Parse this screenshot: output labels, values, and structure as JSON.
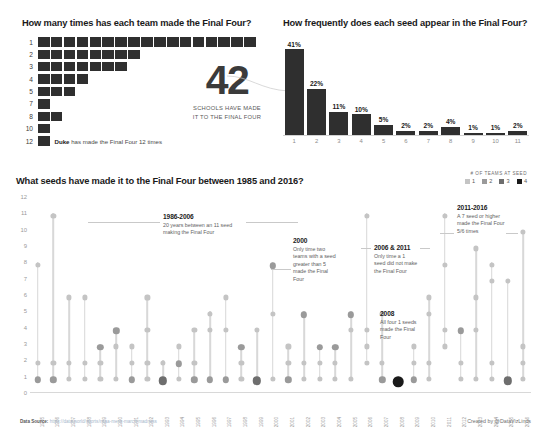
{
  "teams_panel": {
    "title": "How many times has each team made the Final Four?",
    "rows": [
      {
        "label": "1",
        "count": 17,
        "note": ""
      },
      {
        "label": "2",
        "count": 8,
        "note": ""
      },
      {
        "label": "3",
        "count": 7,
        "note": ""
      },
      {
        "label": "4",
        "count": 4,
        "note": ""
      },
      {
        "label": "5",
        "count": 3,
        "note": ""
      },
      {
        "label": "7",
        "count": 1,
        "note": ""
      },
      {
        "label": "8",
        "count": 2,
        "note": ""
      },
      {
        "label": "10",
        "count": 1,
        "note": ""
      },
      {
        "label": "12",
        "count": 1,
        "note_bold": "Duke",
        "note": " has made the Final Four 12 times"
      }
    ]
  },
  "callout": {
    "number": "42",
    "line1": "SCHOOLS HAVE MADE",
    "line2": "IT TO THE FINAL FOUR"
  },
  "freq_panel": {
    "title": "How frequently does each seed appear in the Final Four?"
  },
  "main_panel": {
    "title": "What seeds have made it to the Final Four between 1985 and 2016?",
    "legend_title": "# OF TEAMS AT SEED",
    "legend": [
      {
        "label": "1",
        "color": "#c4c4c4"
      },
      {
        "label": "2",
        "color": "#9a9a9a"
      },
      {
        "label": "3",
        "color": "#6e6e6e"
      },
      {
        "label": "4",
        "color": "#1a1a1a"
      }
    ]
  },
  "annotations": [
    {
      "id": "1986-2006",
      "heading": "1986-2006",
      "body": "20 years between an 11 seed making the Final Four"
    },
    {
      "id": "2000",
      "heading": "2000",
      "body": "Only time two teams with a seed greater than 5 made the Final Four"
    },
    {
      "id": "2006-2011",
      "heading": "2006 & 2011",
      "body": "Only time a 1 seed did not make the Final Four"
    },
    {
      "id": "2008",
      "heading": "2008",
      "body": "All four 1 seeds made the Final Four"
    },
    {
      "id": "2011-2016",
      "heading": "2011-2016",
      "body": "A 7 seed or higher made the Final Four 5/6 times"
    }
  ],
  "footer": {
    "source_label": "Data Source:",
    "source_url": "https://data.world/sports/ncaa-mens-march-madness",
    "credit": "Created by @DataVizLinds"
  },
  "chart_data": [
    {
      "type": "bar",
      "id": "team-appearance-counts",
      "title": "How many times has each team made the Final Four?",
      "orientation": "horizontal",
      "xlabel": "Number of schools",
      "ylabel": "Times made Final Four",
      "categories": [
        "1",
        "2",
        "3",
        "4",
        "5",
        "7",
        "8",
        "10",
        "12"
      ],
      "values": [
        17,
        8,
        7,
        4,
        3,
        1,
        2,
        1,
        1
      ],
      "note": "Bars are segmented — one block per school. Duke has made the Final Four 12 times.",
      "grid": false,
      "legend": "none"
    },
    {
      "type": "bar",
      "id": "seed-frequency",
      "title": "How frequently does each seed appear in the Final Four?",
      "xlabel": "Seed",
      "ylabel": "Percent of Final Four appearances",
      "categories": [
        "1",
        "2",
        "3",
        "4",
        "5",
        "6",
        "7",
        "8",
        "9",
        "10",
        "11"
      ],
      "values": [
        41,
        22,
        11,
        10,
        5,
        2,
        2,
        4,
        1,
        1,
        2
      ],
      "value_labels": [
        "41%",
        "22%",
        "11%",
        "10%",
        "5%",
        "2%",
        "2%",
        "4%",
        "1%",
        "1%",
        "2%"
      ],
      "ylim": [
        0,
        41
      ],
      "grid": false,
      "legend": "none"
    },
    {
      "type": "scatter",
      "id": "seeds-by-year",
      "title": "What seeds have made it to the Final Four between 1985 and 2016?",
      "xlabel": "Year",
      "ylabel": "Seed",
      "ylim": [
        0,
        12
      ],
      "yticks": [
        0,
        1,
        2,
        3,
        4,
        5,
        6,
        7,
        8,
        9,
        10,
        11,
        12
      ],
      "x": [
        "1985",
        "1986",
        "1987",
        "1988",
        "1989",
        "1990",
        "1991",
        "1992",
        "1993",
        "1994",
        "1995",
        "1996",
        "1997",
        "1998",
        "1999",
        "2000",
        "2001",
        "2002",
        "2003",
        "2004",
        "2005",
        "2006",
        "2007",
        "2008",
        "2009",
        "2010",
        "2011",
        "2012",
        "2013",
        "2014",
        "2015",
        "2016"
      ],
      "legend_title": "# OF TEAMS AT SEED",
      "legend_position": "top-right",
      "size_encoding": "marker size and darkness encode number of teams at that seed (1-4)",
      "grid": false,
      "points": [
        {
          "year": "1985",
          "seeds": [
            {
              "seed": 1,
              "teams": 2
            },
            {
              "seed": 2,
              "teams": 1
            },
            {
              "seed": 8,
              "teams": 1
            }
          ]
        },
        {
          "year": "1986",
          "seeds": [
            {
              "seed": 1,
              "teams": 2
            },
            {
              "seed": 2,
              "teams": 1
            },
            {
              "seed": 11,
              "teams": 1
            }
          ]
        },
        {
          "year": "1987",
          "seeds": [
            {
              "seed": 1,
              "teams": 1
            },
            {
              "seed": 2,
              "teams": 1
            },
            {
              "seed": 6,
              "teams": 1
            }
          ]
        },
        {
          "year": "1988",
          "seeds": [
            {
              "seed": 1,
              "teams": 1
            },
            {
              "seed": 2,
              "teams": 1
            },
            {
              "seed": 6,
              "teams": 1
            }
          ]
        },
        {
          "year": "1989",
          "seeds": [
            {
              "seed": 1,
              "teams": 1
            },
            {
              "seed": 2,
              "teams": 1
            },
            {
              "seed": 3,
              "teams": 2
            }
          ]
        },
        {
          "year": "1990",
          "seeds": [
            {
              "seed": 1,
              "teams": 1
            },
            {
              "seed": 3,
              "teams": 1
            },
            {
              "seed": 4,
              "teams": 2
            }
          ]
        },
        {
          "year": "1991",
          "seeds": [
            {
              "seed": 1,
              "teams": 2
            },
            {
              "seed": 2,
              "teams": 1
            },
            {
              "seed": 3,
              "teams": 1
            }
          ]
        },
        {
          "year": "1992",
          "seeds": [
            {
              "seed": 1,
              "teams": 1
            },
            {
              "seed": 2,
              "teams": 1
            },
            {
              "seed": 4,
              "teams": 1
            },
            {
              "seed": 6,
              "teams": 1
            }
          ]
        },
        {
          "year": "1993",
          "seeds": [
            {
              "seed": 1,
              "teams": 3
            },
            {
              "seed": 2,
              "teams": 1
            }
          ]
        },
        {
          "year": "1994",
          "seeds": [
            {
              "seed": 1,
              "teams": 1
            },
            {
              "seed": 2,
              "teams": 2
            },
            {
              "seed": 3,
              "teams": 1
            }
          ]
        },
        {
          "year": "1995",
          "seeds": [
            {
              "seed": 1,
              "teams": 2
            },
            {
              "seed": 2,
              "teams": 1
            },
            {
              "seed": 4,
              "teams": 1
            }
          ]
        },
        {
          "year": "1996",
          "seeds": [
            {
              "seed": 1,
              "teams": 2
            },
            {
              "seed": 4,
              "teams": 1
            },
            {
              "seed": 5,
              "teams": 1
            }
          ]
        },
        {
          "year": "1997",
          "seeds": [
            {
              "seed": 1,
              "teams": 2
            },
            {
              "seed": 4,
              "teams": 1
            },
            {
              "seed": 6,
              "teams": 1
            }
          ]
        },
        {
          "year": "1998",
          "seeds": [
            {
              "seed": 1,
              "teams": 1
            },
            {
              "seed": 2,
              "teams": 1
            },
            {
              "seed": 3,
              "teams": 2
            }
          ]
        },
        {
          "year": "1999",
          "seeds": [
            {
              "seed": 1,
              "teams": 3
            },
            {
              "seed": 4,
              "teams": 1
            }
          ]
        },
        {
          "year": "2000",
          "seeds": [
            {
              "seed": 1,
              "teams": 1
            },
            {
              "seed": 5,
              "teams": 1
            },
            {
              "seed": 8,
              "teams": 2
            }
          ]
        },
        {
          "year": "2001",
          "seeds": [
            {
              "seed": 1,
              "teams": 2
            },
            {
              "seed": 2,
              "teams": 1
            },
            {
              "seed": 3,
              "teams": 1
            }
          ]
        },
        {
          "year": "2002",
          "seeds": [
            {
              "seed": 1,
              "teams": 1
            },
            {
              "seed": 2,
              "teams": 1
            },
            {
              "seed": 5,
              "teams": 2
            }
          ]
        },
        {
          "year": "2003",
          "seeds": [
            {
              "seed": 1,
              "teams": 1
            },
            {
              "seed": 2,
              "teams": 1
            },
            {
              "seed": 3,
              "teams": 2
            }
          ]
        },
        {
          "year": "2004",
          "seeds": [
            {
              "seed": 1,
              "teams": 1
            },
            {
              "seed": 2,
              "teams": 1
            },
            {
              "seed": 3,
              "teams": 2
            }
          ]
        },
        {
          "year": "2005",
          "seeds": [
            {
              "seed": 1,
              "teams": 1
            },
            {
              "seed": 4,
              "teams": 1
            },
            {
              "seed": 5,
              "teams": 2
            }
          ]
        },
        {
          "year": "2006",
          "seeds": [
            {
              "seed": 2,
              "teams": 1
            },
            {
              "seed": 3,
              "teams": 1
            },
            {
              "seed": 4,
              "teams": 1
            },
            {
              "seed": 11,
              "teams": 1
            }
          ]
        },
        {
          "year": "2007",
          "seeds": [
            {
              "seed": 1,
              "teams": 2
            },
            {
              "seed": 2,
              "teams": 1
            },
            {
              "seed": 5,
              "teams": 1
            }
          ]
        },
        {
          "year": "2008",
          "seeds": [
            {
              "seed": 1,
              "teams": 4
            }
          ]
        },
        {
          "year": "2009",
          "seeds": [
            {
              "seed": 1,
              "teams": 2
            },
            {
              "seed": 2,
              "teams": 1
            },
            {
              "seed": 3,
              "teams": 1
            }
          ]
        },
        {
          "year": "2010",
          "seeds": [
            {
              "seed": 1,
              "teams": 1
            },
            {
              "seed": 2,
              "teams": 1
            },
            {
              "seed": 5,
              "teams": 1
            },
            {
              "seed": 6,
              "teams": 1
            }
          ]
        },
        {
          "year": "2011",
          "seeds": [
            {
              "seed": 3,
              "teams": 1
            },
            {
              "seed": 4,
              "teams": 1
            },
            {
              "seed": 8,
              "teams": 1
            },
            {
              "seed": 11,
              "teams": 1
            }
          ]
        },
        {
          "year": "2012",
          "seeds": [
            {
              "seed": 1,
              "teams": 1
            },
            {
              "seed": 2,
              "teams": 1
            },
            {
              "seed": 4,
              "teams": 2
            }
          ]
        },
        {
          "year": "2013",
          "seeds": [
            {
              "seed": 1,
              "teams": 1
            },
            {
              "seed": 4,
              "teams": 1
            },
            {
              "seed": 9,
              "teams": 1
            },
            {
              "seed": 6,
              "teams": 1
            }
          ]
        },
        {
          "year": "2014",
          "seeds": [
            {
              "seed": 1,
              "teams": 1
            },
            {
              "seed": 2,
              "teams": 1
            },
            {
              "seed": 7,
              "teams": 1
            },
            {
              "seed": 8,
              "teams": 1
            }
          ]
        },
        {
          "year": "2015",
          "seeds": [
            {
              "seed": 1,
              "teams": 3
            },
            {
              "seed": 7,
              "teams": 1
            }
          ]
        },
        {
          "year": "2016",
          "seeds": [
            {
              "seed": 1,
              "teams": 1
            },
            {
              "seed": 2,
              "teams": 1
            },
            {
              "seed": 10,
              "teams": 1
            },
            {
              "seed": 3,
              "teams": 1
            }
          ]
        }
      ]
    }
  ]
}
